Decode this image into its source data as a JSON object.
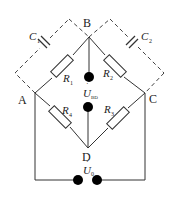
{
  "diagram": {
    "type": "wheatstone-bridge-circuit",
    "nodes": {
      "A": "A",
      "B": "B",
      "C": "C",
      "D": "D"
    },
    "resistors": {
      "r1": {
        "name": "R",
        "sub": "1"
      },
      "r2": {
        "name": "R",
        "sub": "2"
      },
      "r3": {
        "name": "R",
        "sub": "3"
      },
      "r4": {
        "name": "R",
        "sub": "4"
      }
    },
    "capacitors": {
      "c1": {
        "name": "C",
        "sub": "1"
      },
      "c2": {
        "name": "C",
        "sub": "2"
      }
    },
    "voltages": {
      "ubd": {
        "name": "U",
        "sub": "BD",
        "dot": "·"
      },
      "u0": {
        "name": "U",
        "sub": "0",
        "dot": "·"
      }
    },
    "colors": {
      "line": "#333333",
      "terminal": "#000000",
      "background": "#ffffff"
    }
  }
}
